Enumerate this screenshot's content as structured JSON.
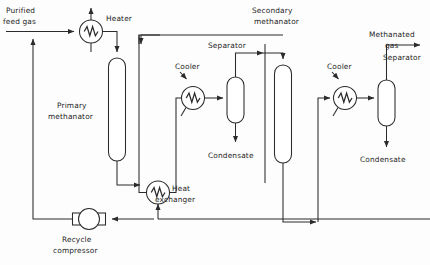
{
  "diagram": {
    "type": "process-flow-diagram",
    "stroke_color": "#2b2b2b",
    "background_color": "#fdfdfd",
    "labels": {
      "purified_feed_gas_line1": "Purified",
      "purified_feed_gas_line2": "feed gas",
      "heater": "Heater",
      "primary_methanator_line1": "Primary",
      "primary_methanator_line2": "methanator",
      "cooler_left": "Cooler",
      "separator_left": "Separator",
      "condensate_left": "Condensate",
      "heat_exchanger_line1": "Heat",
      "heat_exchanger_line2": "exchanger",
      "recycle_compressor_line1": "Recycle",
      "recycle_compressor_line2": "compressor",
      "secondary_methanator_line1": "Secondary",
      "secondary_methanator_line2": "methanator",
      "cooler_right": "Cooler",
      "separator_right": "Separator",
      "methanated_gas_line1": "Methanated",
      "methanated_gas_line2": "gas",
      "condensate_right": "Condensate"
    },
    "equipment": [
      {
        "id": "heater",
        "name": "Heater",
        "symbol": "circle-zigzag"
      },
      {
        "id": "primary-methanator",
        "name": "Primary methanator",
        "symbol": "vertical-vessel"
      },
      {
        "id": "cooler-left",
        "name": "Cooler",
        "symbol": "circle-zigzag"
      },
      {
        "id": "separator-left",
        "name": "Separator",
        "symbol": "vertical-vessel"
      },
      {
        "id": "heat-exchanger",
        "name": "Heat exchanger",
        "symbol": "circle-zigzag"
      },
      {
        "id": "recycle-compressor",
        "name": "Recycle compressor",
        "symbol": "circle-with-flanges"
      },
      {
        "id": "secondary-methanator",
        "name": "Secondary methanator",
        "symbol": "vertical-vessel"
      },
      {
        "id": "cooler-right",
        "name": "Cooler",
        "symbol": "circle-zigzag"
      },
      {
        "id": "separator-right",
        "name": "Separator",
        "symbol": "vertical-vessel"
      }
    ],
    "streams": [
      {
        "id": "feed",
        "name": "Purified feed gas",
        "from": "battery-limit",
        "to": "heater"
      },
      {
        "id": "recycle",
        "name": "Recycle gas",
        "from": "recycle-compressor",
        "to": "feed"
      },
      {
        "id": "heater-out",
        "name": "Heated gas",
        "from": "heater",
        "to": "primary-methanator"
      },
      {
        "id": "primary-out",
        "name": "Primary methanator effluent",
        "from": "primary-methanator",
        "to": "heat-exchanger"
      },
      {
        "id": "hx-out",
        "name": "Cooled effluent",
        "from": "heat-exchanger",
        "to": "cooler-left"
      },
      {
        "id": "cooler-left-out",
        "name": "Condensed stream",
        "from": "cooler-left",
        "to": "separator-left"
      },
      {
        "id": "sep-left-vap",
        "name": "Separator overhead",
        "from": "separator-left",
        "to": "secondary-methanator"
      },
      {
        "id": "sep-left-liq",
        "name": "Condensate",
        "from": "separator-left",
        "to": "condensate"
      },
      {
        "id": "secondary-out",
        "name": "Secondary methanator effluent",
        "from": "secondary-methanator",
        "to": "cooler-right"
      },
      {
        "id": "cooler-right-out",
        "name": "Cooled product",
        "from": "cooler-right",
        "to": "separator-right"
      },
      {
        "id": "sep-right-vap",
        "name": "Methanated gas",
        "from": "separator-right",
        "to": "battery-limit"
      },
      {
        "id": "sep-right-liq",
        "name": "Condensate",
        "from": "separator-right",
        "to": "condensate"
      }
    ]
  }
}
